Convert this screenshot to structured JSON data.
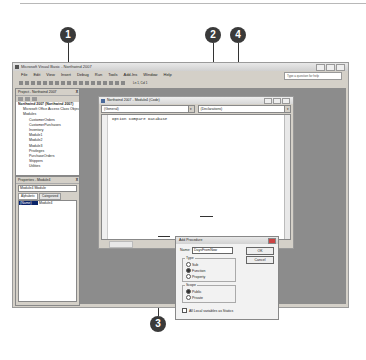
{
  "callouts": [
    {
      "id": "1",
      "label": "1"
    },
    {
      "id": "2",
      "label": "2"
    },
    {
      "id": "3",
      "label": "3"
    },
    {
      "id": "4",
      "label": "4"
    }
  ],
  "app": {
    "title": "Microsoft Visual Basic - Northwind 2007",
    "menu": [
      "File",
      "Edit",
      "View",
      "Insert",
      "Debug",
      "Run",
      "Tools",
      "Add-Ins",
      "Window",
      "Help"
    ],
    "help_placeholder": "Type a question for help",
    "cursor_position": "Ln 1, Col 1"
  },
  "project_pane": {
    "title": "Project - Northwind 2007",
    "close": "X",
    "tree": {
      "root": "Northwind 2007 (Northwind 2007)",
      "objects_folder": "Microsoft Office Access Class Objects",
      "modules_folder": "Modules",
      "modules": [
        "CustomerOrders",
        "CustomerPurchases",
        "Inventory",
        "Module1",
        "Module2",
        "Module3",
        "Privileges",
        "PurchaseOrders",
        "Shippers",
        "Utilities"
      ]
    }
  },
  "properties_pane": {
    "title": "Properties - Module4",
    "close": "X",
    "selector": "Module4 Module",
    "tabs": [
      "Alphabetic",
      "Categorized"
    ],
    "rows": [
      {
        "key": "(Name)",
        "value": "Module4"
      }
    ]
  },
  "code_window": {
    "title": "Northwind 2007 - Module4 (Code)",
    "object_combo": "(General)",
    "procedure_combo": "(Declarations)",
    "code": "Option Compare Database"
  },
  "add_procedure_dialog": {
    "title": "Add Procedure",
    "name_label": "Name:",
    "name_value": "DaysFromNow",
    "ok_label": "OK",
    "cancel_label": "Cancel",
    "type_group": {
      "label": "Type",
      "options": [
        "Sub",
        "Function",
        "Property"
      ],
      "selected": "Function"
    },
    "scope_group": {
      "label": "Scope",
      "options": [
        "Public",
        "Private"
      ],
      "selected": "Public"
    },
    "statics_checkbox": {
      "label": "All Local variables as Statics",
      "checked": false
    }
  }
}
